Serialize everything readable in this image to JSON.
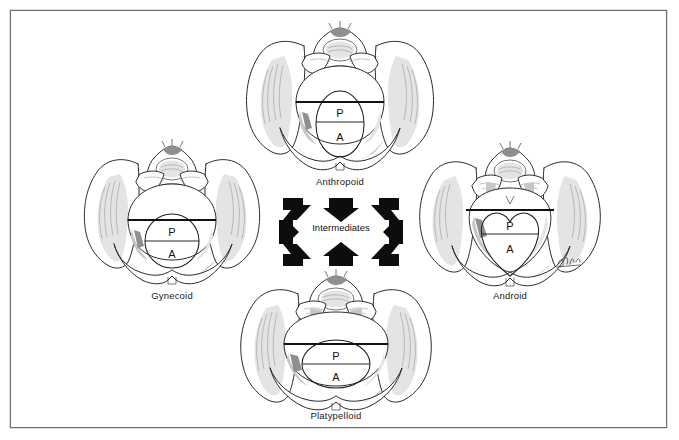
{
  "figure": {
    "background_color": "#ffffff",
    "border_color": "#6d6d6d"
  },
  "center": {
    "label": "Intermediates",
    "arrow_count": 8,
    "arrow_color": "#0d0d0d",
    "arrow_directions": [
      "down-right",
      "down",
      "down-left",
      "right",
      "left",
      "up-right",
      "up",
      "up-left"
    ]
  },
  "pelvis_types": [
    {
      "id": "anthropoid",
      "caption": "Anthropoid",
      "inlet_shape": "vertical-oval",
      "posterior_label": "P",
      "anterior_label": "A",
      "position": "top-center"
    },
    {
      "id": "gynecoid",
      "caption": "Gynecoid",
      "inlet_shape": "circle",
      "posterior_label": "P",
      "anterior_label": "A",
      "position": "left"
    },
    {
      "id": "android",
      "caption": "Android",
      "inlet_shape": "heart",
      "posterior_label": "P",
      "anterior_label": "A",
      "position": "right"
    },
    {
      "id": "platypelloid",
      "caption": "Platypelloid",
      "inlet_shape": "wide-oval",
      "posterior_label": "P",
      "anterior_label": "A",
      "position": "bottom-center"
    }
  ]
}
